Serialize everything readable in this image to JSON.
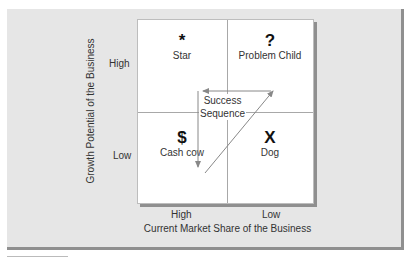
{
  "diagram": {
    "type": "2x2-matrix",
    "y_axis": {
      "label": "Growth Potential of the Business",
      "ticks": [
        "High",
        "Low"
      ]
    },
    "x_axis": {
      "label": "Current Market Share of the Business",
      "ticks": [
        "High",
        "Low"
      ]
    },
    "quadrants": [
      {
        "position": "top-left",
        "symbol": "*",
        "label": "Star"
      },
      {
        "position": "top-right",
        "symbol": "?",
        "label": "Problem Child"
      },
      {
        "position": "bottom-left",
        "symbol": "$",
        "label": "Cash cow"
      },
      {
        "position": "bottom-right",
        "symbol": "X",
        "label": "Dog"
      }
    ],
    "sequence": {
      "label_line1": "Success",
      "label_line2": "Sequence",
      "path": [
        "Cash cow",
        "Problem Child",
        "Star",
        "Cash cow"
      ]
    }
  },
  "colors": {
    "panel": "#e6e6e6",
    "shadow": "#8f8f8f",
    "grid": "#a8a8a8",
    "arrow": "#888888"
  }
}
